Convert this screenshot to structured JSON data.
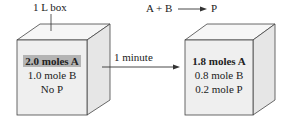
{
  "top_label": "1 L box",
  "reaction": {
    "lhs": "A + B",
    "rhs": "P"
  },
  "arrow_label": "1 minute",
  "box_before": {
    "lines": [
      "2.0 moles A",
      "1.0 mole B",
      "No P"
    ],
    "highlight_color": "#b4b4b4"
  },
  "box_after": {
    "lines": [
      "1.8 moles A",
      "0.8 mole B",
      "0.2 mole P"
    ]
  },
  "colors": {
    "front_face": "#efefef",
    "top_face": "#f6f6f6",
    "side_face": "#e6e6e6",
    "edge": "#444444"
  }
}
